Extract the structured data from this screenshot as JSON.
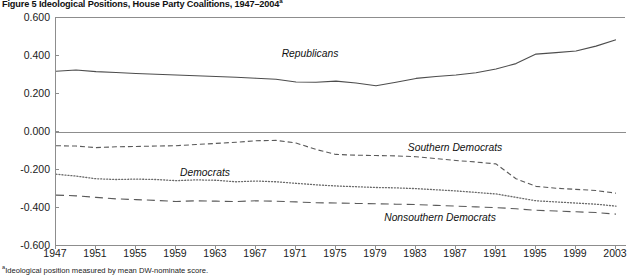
{
  "figure": {
    "title_prefix": "Figure 5",
    "title": "Figure 5  Ideological Positions, House Party Coalitions, 1947–2004",
    "title_superscript": "a",
    "footnote_marker": "a",
    "footnote": "Ideological position measured by mean DW-nominate score."
  },
  "chart_data": {
    "type": "line",
    "title": "Figure 5  Ideological Positions, House Party Coalitions, 1947–2004",
    "xlabel": "",
    "ylabel": "",
    "xlim": [
      1947,
      2004
    ],
    "ylim": [
      -0.6,
      0.6
    ],
    "grid": false,
    "legend": "inline-labels",
    "y_ticks": [
      "0.600",
      "0.400",
      "0.200",
      "0.000",
      "-0.200",
      "-0.400",
      "-0.600"
    ],
    "y_tick_values": [
      0.6,
      0.4,
      0.2,
      0.0,
      -0.2,
      -0.4,
      -0.6
    ],
    "x_ticks": [
      "1947",
      "1951",
      "1955",
      "1959",
      "1963",
      "1967",
      "1971",
      "1975",
      "1979",
      "1983",
      "1987",
      "1991",
      "1995",
      "1999",
      "2003"
    ],
    "x_tick_values": [
      1947,
      1951,
      1955,
      1959,
      1963,
      1967,
      1971,
      1975,
      1979,
      1983,
      1987,
      1991,
      1995,
      1999,
      2003
    ],
    "x": [
      1947,
      1949,
      1951,
      1953,
      1955,
      1957,
      1959,
      1961,
      1963,
      1965,
      1967,
      1969,
      1971,
      1973,
      1975,
      1977,
      1979,
      1981,
      1983,
      1985,
      1987,
      1989,
      1991,
      1993,
      1995,
      1997,
      1999,
      2001,
      2003
    ],
    "series": [
      {
        "name": "Republicans",
        "style": "solid",
        "color": "#4d4d4d",
        "values": [
          0.32,
          0.326,
          0.318,
          0.313,
          0.308,
          0.304,
          0.3,
          0.296,
          0.292,
          0.288,
          0.283,
          0.278,
          0.263,
          0.262,
          0.268,
          0.258,
          0.243,
          0.262,
          0.282,
          0.292,
          0.3,
          0.312,
          0.332,
          0.36,
          0.41,
          0.418,
          0.426,
          0.452,
          0.486
        ]
      },
      {
        "name": "Southern Democrats",
        "style": "dashed",
        "color": "#5a5a5a",
        "values": [
          -0.072,
          -0.074,
          -0.082,
          -0.078,
          -0.076,
          -0.074,
          -0.072,
          -0.066,
          -0.06,
          -0.054,
          -0.046,
          -0.044,
          -0.058,
          -0.092,
          -0.118,
          -0.122,
          -0.124,
          -0.126,
          -0.13,
          -0.14,
          -0.15,
          -0.158,
          -0.168,
          -0.246,
          -0.286,
          -0.296,
          -0.302,
          -0.308,
          -0.322
        ]
      },
      {
        "name": "Democrats",
        "style": "dotted",
        "color": "#6a6a6a",
        "values": [
          -0.222,
          -0.232,
          -0.246,
          -0.25,
          -0.248,
          -0.25,
          -0.256,
          -0.252,
          -0.254,
          -0.262,
          -0.258,
          -0.262,
          -0.27,
          -0.278,
          -0.284,
          -0.288,
          -0.292,
          -0.294,
          -0.298,
          -0.304,
          -0.31,
          -0.318,
          -0.326,
          -0.344,
          -0.362,
          -0.368,
          -0.374,
          -0.38,
          -0.39
        ]
      },
      {
        "name": "Nonsouthern Democrats",
        "style": "longdash",
        "color": "#5a5a5a",
        "values": [
          -0.332,
          -0.336,
          -0.344,
          -0.352,
          -0.356,
          -0.36,
          -0.366,
          -0.362,
          -0.364,
          -0.366,
          -0.362,
          -0.364,
          -0.368,
          -0.372,
          -0.374,
          -0.376,
          -0.378,
          -0.38,
          -0.382,
          -0.386,
          -0.39,
          -0.394,
          -0.398,
          -0.404,
          -0.412,
          -0.416,
          -0.42,
          -0.424,
          -0.432
        ]
      }
    ],
    "series_labels": [
      {
        "text": "Republicans",
        "x": 1972.5,
        "y": 0.408
      },
      {
        "text": "Southern Democrats",
        "x": 1987.0,
        "y": -0.082
      },
      {
        "text": "Democrats",
        "x": 1962.0,
        "y": -0.215
      },
      {
        "text": "Nonsouthern Democrats",
        "x": 1985.5,
        "y": -0.455
      }
    ],
    "zero_line": 0.0
  }
}
